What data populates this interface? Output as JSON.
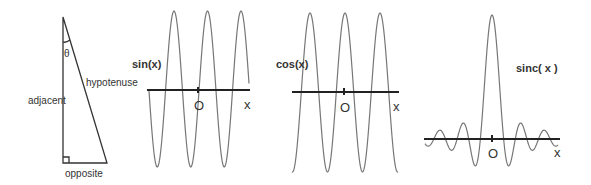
{
  "triangle": {
    "angle_label": "θ",
    "hypotenuse_label": "hypotenuse",
    "adjacent_label": "adjacent",
    "opposite_label": "opposite"
  },
  "plots": [
    {
      "id": "sin",
      "label": "sin(x)",
      "origin_label": "O",
      "axis_label": "x"
    },
    {
      "id": "cos",
      "label": "cos(x)",
      "origin_label": "O",
      "axis_label": "x"
    },
    {
      "id": "sinc",
      "label": "sinc( x )",
      "origin_label": "O",
      "axis_label": "x"
    }
  ],
  "colors": {
    "curve": "#777777",
    "axis": "#222222",
    "text": "#333333",
    "background": "#ffffff"
  }
}
